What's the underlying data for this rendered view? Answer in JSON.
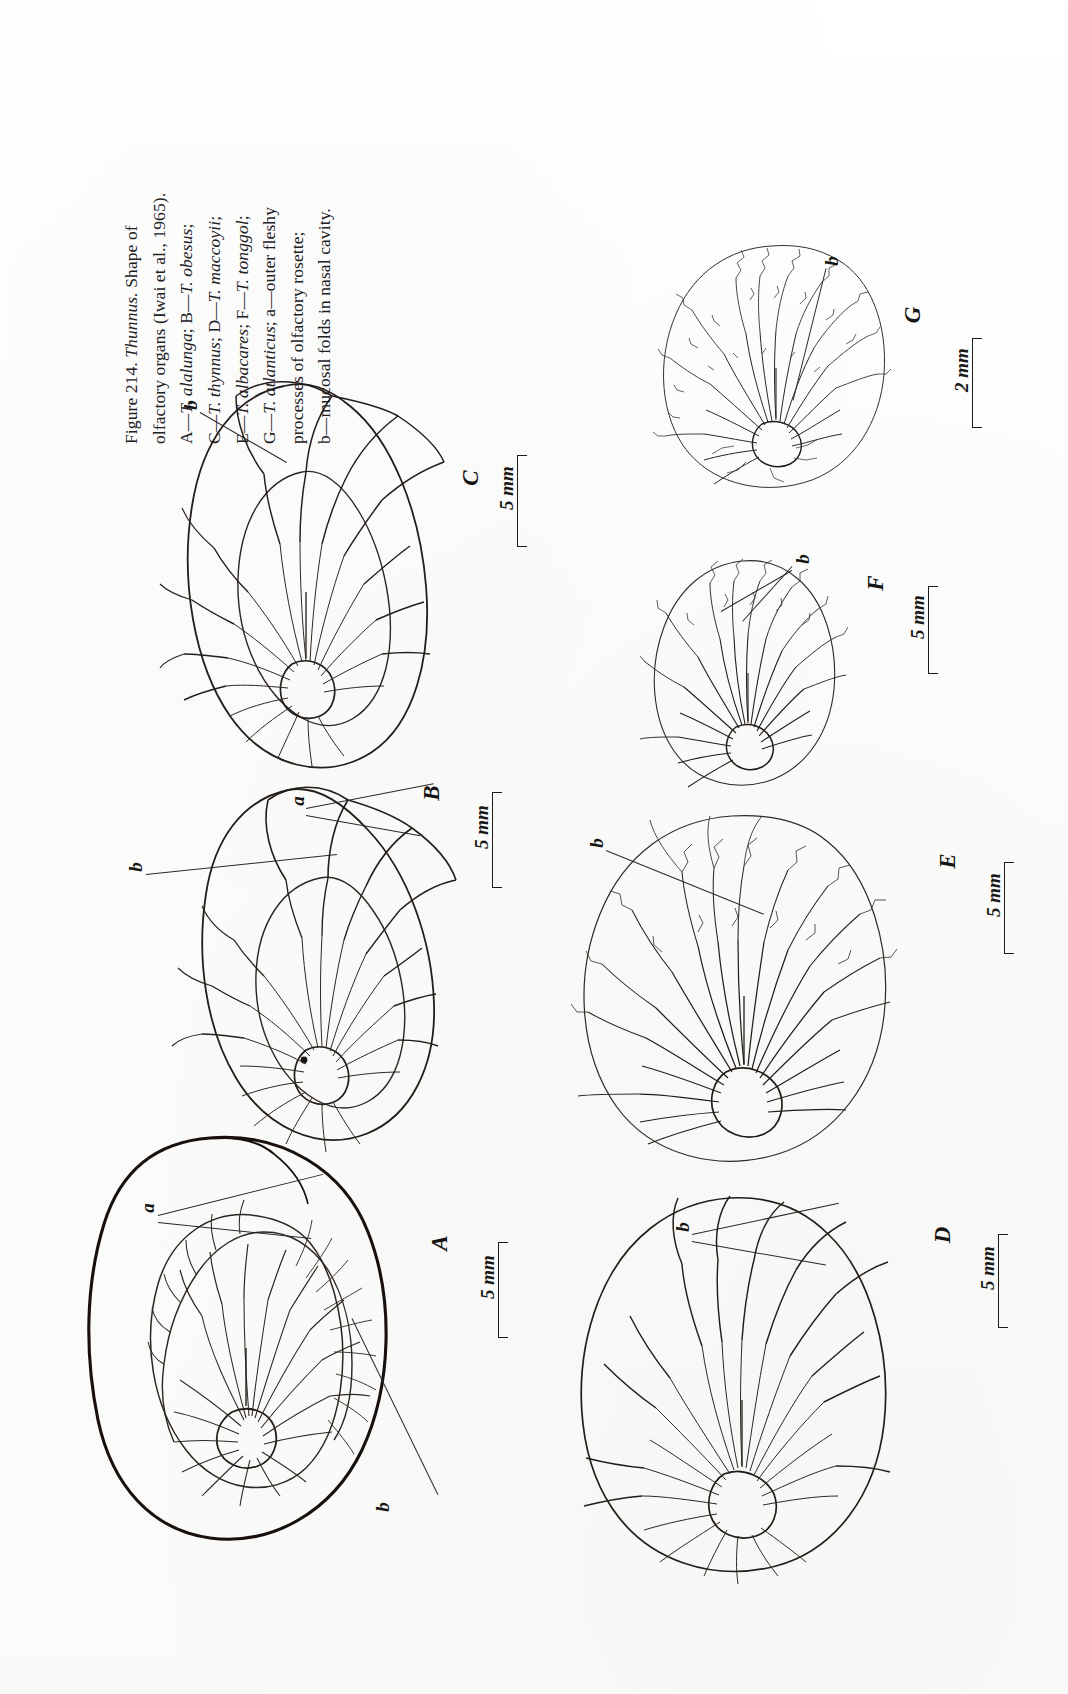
{
  "figure": {
    "number": "Figure 214.",
    "genus": "Thunnus.",
    "title_rest": "Shape of",
    "caption_lines": [
      "Figure 214.  Thunnus.  Shape of",
      "olfactory organs (Iwai et al., 1965).",
      "A—T. alalunga; B—T. obesus;",
      "C—T. thynnus; D—T. maccoyii;",
      "E—T. albacares; F—T. tonggol;",
      "G—T. atlanticus; a—outer fleshy",
      "processes of olfactory rosette;",
      "b—mucosal folds in nasal cavity."
    ],
    "caption_rich": [
      {
        "plain": "Figure 214. ",
        "italic": "Thunnus.",
        "plain2": " Shape of"
      },
      {
        "plain": "olfactory organs (Iwai et al., 1965).",
        "italic": "",
        "plain2": ""
      },
      {
        "plain": "A—",
        "italic": "T. alalunga",
        "plain2": "; B—T. obesus;"
      },
      {
        "plain": "C—",
        "italic": "T. thynnus",
        "plain2": "; D—T. maccoyii;"
      },
      {
        "plain": "E—",
        "italic": "T. albacares",
        "plain2": "; F—T. tonggol;"
      },
      {
        "plain": "G—",
        "italic": "T. atlanticus",
        "plain2": "; a—outer fleshy"
      },
      {
        "plain": "processes of olfactory rosette;",
        "italic": "",
        "plain2": ""
      },
      {
        "plain": "b—mucosal folds in nasal cavity.",
        "italic": "",
        "plain2": ""
      }
    ],
    "caption_line_1_prefix": "Figure 214. ",
    "caption_line_1_italic": "Thunnus.",
    "caption_line_1_suffix": " Shape of",
    "caption_line_2": "olfactory organs (Iwai et al., 1965).",
    "caption_line_3_prefix": "A—",
    "caption_line_3_italic": "T. alalunga",
    "caption_line_3_mid": "; B—",
    "caption_line_3_italic2": "T. obesus",
    "caption_line_3_suffix": ";",
    "caption_line_4_prefix": "C—",
    "caption_line_4_italic": "T. thynnus",
    "caption_line_4_mid": "; D—",
    "caption_line_4_italic2": "T. maccoyii",
    "caption_line_4_suffix": ";",
    "caption_line_5_prefix": "E—",
    "caption_line_5_italic": "T. albacares",
    "caption_line_5_mid": "; F—",
    "caption_line_5_italic2": "T. tonggol",
    "caption_line_5_suffix": ";",
    "caption_line_6_prefix": "G—",
    "caption_line_6_italic": "T. atlanticus",
    "caption_line_6_suffix": "; a—outer fleshy",
    "caption_line_7": "processes of olfactory rosette;",
    "caption_line_8": "b—mucosal folds in nasal cavity."
  },
  "panels": [
    {
      "id": "A",
      "letter": "A",
      "species": "T. alalunga",
      "scale": "5 mm"
    },
    {
      "id": "B",
      "letter": "B",
      "species": "T. obesus",
      "scale": "5 mm"
    },
    {
      "id": "C",
      "letter": "C",
      "species": "T. thynnus",
      "scale": "5 mm"
    },
    {
      "id": "D",
      "letter": "D",
      "species": "T. maccoyii",
      "scale": "5 mm"
    },
    {
      "id": "E",
      "letter": "E",
      "species": "T. albacares",
      "scale": "5 mm"
    },
    {
      "id": "F",
      "letter": "F",
      "species": "T. tonggol",
      "scale": "5 mm"
    },
    {
      "id": "G",
      "letter": "G",
      "species": "T. atlanticus",
      "scale": "2 mm"
    }
  ],
  "annotations": {
    "a_label": "a",
    "b_label": "b",
    "a_meaning": "outer fleshy processes of olfactory rosette",
    "b_meaning": "mucosal folds in nasal cavity",
    "marks": [
      {
        "panel": "A",
        "label": "a"
      },
      {
        "panel": "A",
        "label": "b"
      },
      {
        "panel": "B",
        "label": "a"
      },
      {
        "panel": "B",
        "label": "b"
      },
      {
        "panel": "C",
        "label": "b"
      },
      {
        "panel": "D",
        "label": "b"
      },
      {
        "panel": "E",
        "label": "b"
      },
      {
        "panel": "F",
        "label": "b"
      },
      {
        "panel": "G",
        "label": "b"
      }
    ]
  },
  "colors": {
    "ink": "#1a1a1a",
    "paper": "#ffffff",
    "line": "#2a2a28"
  }
}
